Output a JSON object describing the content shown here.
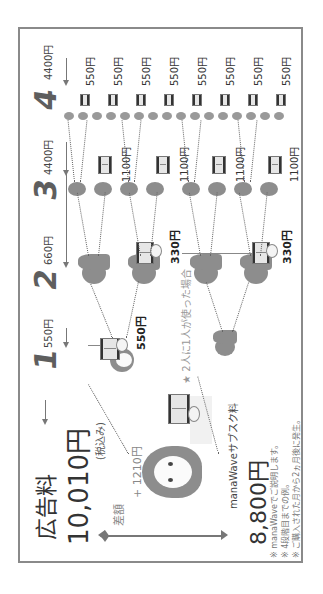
{
  "header": {
    "title": "広告料",
    "total_price": "10,010円",
    "tax_note": "(税込み)"
  },
  "difference": {
    "label": "差額",
    "amount": "+ 1210円"
  },
  "subscription": {
    "label": "manaWaveサブスク料",
    "price": "8,800円"
  },
  "scenario_note": "★ 2人に1人が使った場合",
  "levels": [
    {
      "number": "1",
      "total": "550円",
      "per_unit": "550円"
    },
    {
      "number": "2",
      "total": "660円",
      "per_unit": "330円"
    },
    {
      "number": "3",
      "total": "4400円",
      "per_unit": "1100円"
    },
    {
      "number": "4",
      "total": "4400円",
      "per_unit": "550円"
    }
  ],
  "notes": [
    "※ manaWaveでご説明します。",
    "※ 4段階目までの例。",
    "※ ご購入された月から2ヵ月後に発生。"
  ],
  "colors": {
    "frame": "#8a8a8a",
    "person": "#8d8d8d",
    "text": "#333333",
    "muted": "#888888"
  }
}
